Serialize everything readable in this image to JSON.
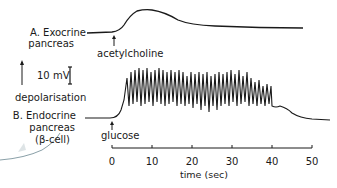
{
  "panel_a": {
    "label_line1": "A. Exocrine",
    "label_line2": "pancreas",
    "stimulus": "acetylcholine"
  },
  "panel_b": {
    "label_line1": "B. Endocrine",
    "label_line2": "pancreas",
    "label_line3": "(β-cell)",
    "stimulus": "glucose"
  },
  "scale": {
    "voltage": "10 mV",
    "direction": "depolarisation"
  },
  "axis": {
    "ticks": [
      "0",
      "10",
      "20",
      "30",
      "40",
      "50"
    ],
    "label": "time (sec)"
  },
  "colors": {
    "trace": "#1a1a1a",
    "background": "#ffffff",
    "stray_mark": "#8aa0a8"
  }
}
